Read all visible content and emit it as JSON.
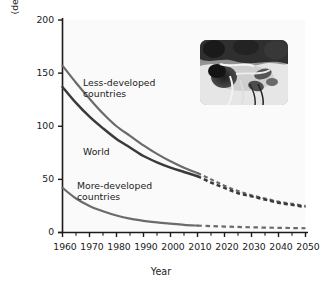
{
  "chart_data": {
    "type": "line",
    "title": "",
    "xlabel": "Year",
    "ylabel_line1": "Infant mortality rate",
    "ylabel_line2": "(deaths per 1,000 live births)",
    "xlim": [
      1960,
      2050
    ],
    "ylim": [
      0,
      200
    ],
    "grid": false,
    "legend": "inline-labels",
    "yticks": [
      0,
      50,
      100,
      150,
      200
    ],
    "ytick_labels": [
      "0",
      "50",
      "100",
      "150",
      "200"
    ],
    "xticks": [
      1960,
      1970,
      1980,
      1990,
      2000,
      2010,
      2020,
      2030,
      2040,
      2050
    ],
    "xtick_labels": [
      "1960",
      "1970",
      "1980",
      "1990",
      "2000",
      "2010",
      "2020",
      "2030",
      "2040",
      "2050"
    ],
    "minor_xtick_interval": 5,
    "projection_starts": 2010,
    "x": [
      1960,
      1965,
      1970,
      1975,
      1980,
      1985,
      1990,
      1995,
      2000,
      2005,
      2010,
      2015,
      2020,
      2025,
      2030,
      2035,
      2040,
      2045,
      2050
    ],
    "series": [
      {
        "name": "Less-developed countries",
        "label_line1": "Less-developed",
        "label_line2": "countries",
        "color": "#6b6b6b",
        "values": [
          157,
          141,
          126,
          112,
          100,
          91,
          82,
          74,
          67,
          61,
          56,
          50,
          44,
          39,
          35,
          32,
          29,
          27,
          25
        ]
      },
      {
        "name": "World",
        "label_line1": "World",
        "label_line2": "",
        "color": "#3a3a3a",
        "values": [
          137,
          122,
          109,
          98,
          88,
          80,
          72,
          66,
          61,
          57,
          53,
          47,
          42,
          37,
          34,
          31,
          28,
          26,
          24
        ]
      },
      {
        "name": "More-developed countries",
        "label_line1": "More-developed",
        "label_line2": "countries",
        "color": "#6b6b6b",
        "values": [
          42,
          32,
          25,
          20,
          16,
          13,
          11,
          9.5,
          8.3,
          7.2,
          6.5,
          6.0,
          5.6,
          5.2,
          4.9,
          4.6,
          4.4,
          4.2,
          4.0
        ]
      }
    ]
  },
  "inset": {
    "name": "infant-in-incubator-photograph",
    "description": "grayscale photo of an infant with medical tubing"
  },
  "colors": {
    "axis": "#1a1a1a",
    "plot_background": "#fafafa",
    "page_background": "#ffffff",
    "text": "#1b1b1b"
  }
}
